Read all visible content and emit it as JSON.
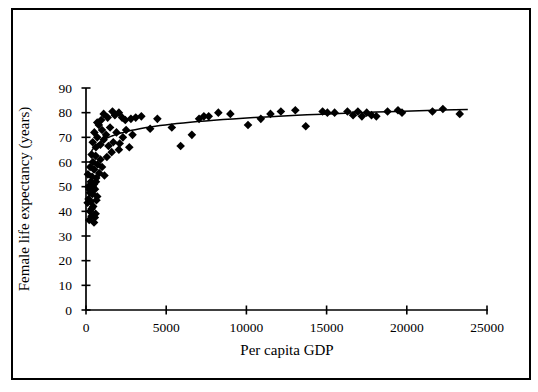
{
  "colors": {
    "background": "#ffffff",
    "frame": "#000000",
    "axes": "#000000",
    "points": "#000000",
    "trendline": "#000000"
  },
  "chart_data": {
    "type": "scatter",
    "title": "",
    "xlabel": "Per capita GDP",
    "ylabel": "Female life expectancy (years)",
    "xlim": [
      0,
      25000
    ],
    "ylim": [
      0,
      90
    ],
    "x_ticks": [
      0,
      5000,
      10000,
      15000,
      20000,
      25000
    ],
    "y_ticks": [
      0,
      10,
      20,
      30,
      40,
      50,
      60,
      70,
      80,
      90
    ],
    "grid": false,
    "legend": null,
    "marker": {
      "shape": "diamond",
      "color": "#000000",
      "size": 9
    },
    "points": [
      [
        100,
        43.5
      ],
      [
        160,
        45
      ],
      [
        200,
        36.5
      ],
      [
        250,
        40
      ],
      [
        300,
        44
      ],
      [
        340,
        38
      ],
      [
        400,
        47
      ],
      [
        450,
        42
      ],
      [
        500,
        35.5
      ],
      [
        560,
        49
      ],
      [
        600,
        39
      ],
      [
        650,
        44.5
      ],
      [
        700,
        46
      ],
      [
        150,
        50
      ],
      [
        300,
        52
      ],
      [
        500,
        51
      ],
      [
        250,
        47.5
      ],
      [
        420,
        50
      ],
      [
        620,
        52
      ],
      [
        350,
        41
      ],
      [
        210,
        49
      ],
      [
        550,
        37.5
      ],
      [
        120,
        55
      ],
      [
        260,
        58
      ],
      [
        380,
        54
      ],
      [
        430,
        60
      ],
      [
        500,
        57
      ],
      [
        640,
        53.5
      ],
      [
        720,
        59
      ],
      [
        820,
        55.5
      ],
      [
        900,
        61
      ],
      [
        1000,
        58
      ],
      [
        1150,
        54.5
      ],
      [
        1300,
        62
      ],
      [
        600,
        62.5
      ],
      [
        350,
        63
      ],
      [
        420,
        68
      ],
      [
        520,
        72
      ],
      [
        620,
        66
      ],
      [
        700,
        70
      ],
      [
        800,
        75
      ],
      [
        900,
        67
      ],
      [
        1000,
        73
      ],
      [
        1100,
        69
      ],
      [
        1250,
        71
      ],
      [
        1400,
        66.5
      ],
      [
        1500,
        74
      ],
      [
        1700,
        68
      ],
      [
        1900,
        72
      ],
      [
        2100,
        67.5
      ],
      [
        2300,
        70
      ],
      [
        2500,
        73
      ],
      [
        2700,
        66
      ],
      [
        2900,
        71
      ],
      [
        1600,
        64
      ],
      [
        2050,
        65
      ],
      [
        700,
        76
      ],
      [
        950,
        77
      ],
      [
        1100,
        79.5
      ],
      [
        1350,
        78
      ],
      [
        1650,
        80.5
      ],
      [
        1800,
        79
      ],
      [
        2050,
        80
      ],
      [
        2250,
        78
      ],
      [
        2450,
        77
      ],
      [
        2800,
        77.5
      ],
      [
        3100,
        78
      ],
      [
        3450,
        78.5
      ],
      [
        4000,
        73.5
      ],
      [
        4450,
        77.5
      ],
      [
        5350,
        74
      ],
      [
        5900,
        66.5
      ],
      [
        6600,
        71
      ],
      [
        7050,
        77.5
      ],
      [
        7350,
        78.5
      ],
      [
        7650,
        78.5
      ],
      [
        8250,
        80
      ],
      [
        9000,
        79.5
      ],
      [
        10100,
        75
      ],
      [
        10900,
        77.5
      ],
      [
        11500,
        79.5
      ],
      [
        12150,
        80.5
      ],
      [
        13050,
        81
      ],
      [
        13700,
        74.5
      ],
      [
        14750,
        80.5
      ],
      [
        15050,
        80
      ],
      [
        15500,
        80
      ],
      [
        16300,
        80.5
      ],
      [
        16650,
        79
      ],
      [
        16950,
        80.5
      ],
      [
        17200,
        78.5
      ],
      [
        17500,
        80
      ],
      [
        17800,
        79
      ],
      [
        18100,
        78.5
      ],
      [
        18800,
        80.5
      ],
      [
        19450,
        81
      ],
      [
        19700,
        80
      ],
      [
        21600,
        80.5
      ],
      [
        22250,
        81.5
      ],
      [
        23300,
        79.5
      ]
    ],
    "trendline": {
      "type": "logarithmic",
      "formula": "life_expectancy = 41 + 4.0 * ln(gdp)",
      "a": 41,
      "b": 4.0,
      "gdp_range": [
        300,
        23800
      ]
    }
  }
}
